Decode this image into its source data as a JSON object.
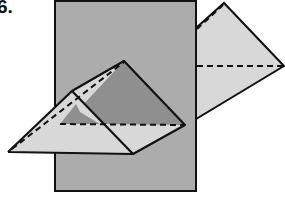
{
  "problem": {
    "number_label": "6."
  },
  "diagram": {
    "colors": {
      "plane": "#acacac",
      "light_face": "#d8d8d8",
      "dark_face": "#8f8f8f",
      "stroke": "#111111"
    }
  }
}
